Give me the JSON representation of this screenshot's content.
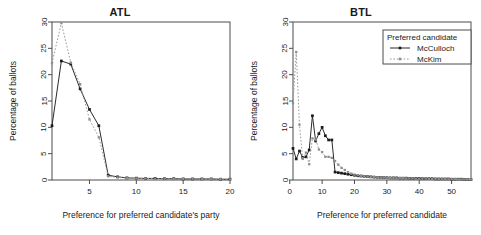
{
  "figure": {
    "width": 481,
    "height": 235,
    "background": "#ffffff"
  },
  "legend": {
    "title": "Preferred candidate",
    "position": "top-right-of-btl-panel",
    "entries": [
      {
        "label": "McCulloch",
        "style": "solid",
        "color": "#2b2b2b",
        "marker": "square"
      },
      {
        "label": "McKim",
        "style": "dotted",
        "color": "#9a9a9a",
        "marker": "square"
      }
    ]
  },
  "chart_data": [
    {
      "type": "line",
      "title": "ATL",
      "xlabel": "Preference for preferred candidate's party",
      "ylabel": "Percentage of ballots",
      "xlim": [
        1,
        20
      ],
      "ylim": [
        0,
        30
      ],
      "xticks": [
        5,
        10,
        15,
        20
      ],
      "yticks": [
        0,
        5,
        10,
        15,
        20,
        25,
        30
      ],
      "grid": false,
      "x": [
        1,
        2,
        3,
        4,
        5,
        6,
        7,
        8,
        9,
        10,
        11,
        12,
        13,
        14,
        15,
        16,
        17,
        18,
        19,
        20
      ],
      "series": [
        {
          "name": "McCulloch",
          "style": "solid",
          "color": "#2b2b2b",
          "values": [
            10.3,
            22.6,
            22.0,
            17.3,
            13.4,
            10.3,
            0.9,
            0.6,
            0.4,
            0.35,
            0.3,
            0.3,
            0.25,
            0.25,
            0.2,
            0.2,
            0.2,
            0.2,
            0.15,
            0.15
          ]
        },
        {
          "name": "McKim",
          "style": "dotted",
          "color": "#9a9a9a",
          "values": [
            22.2,
            29.8,
            22.3,
            18.2,
            11.5,
            8.1,
            0.7,
            0.5,
            0.35,
            0.3,
            0.3,
            0.25,
            0.25,
            0.2,
            0.2,
            0.2,
            0.15,
            0.15,
            0.15,
            0.1
          ]
        }
      ]
    },
    {
      "type": "line",
      "title": "BTL",
      "xlabel": "Preference for preferred candidate",
      "ylabel": "Percentage of ballots",
      "xlim": [
        1,
        56
      ],
      "ylim": [
        0,
        30
      ],
      "xticks": [
        0,
        10,
        20,
        30,
        40,
        50
      ],
      "yticks": [
        0,
        5,
        10,
        15,
        20,
        25,
        30
      ],
      "grid": false,
      "x": [
        1,
        2,
        3,
        4,
        5,
        6,
        7,
        8,
        9,
        10,
        11,
        12,
        13,
        14,
        15,
        16,
        17,
        18,
        19,
        20,
        21,
        22,
        23,
        24,
        25,
        26,
        27,
        28,
        29,
        30,
        31,
        32,
        33,
        34,
        35,
        36,
        37,
        38,
        39,
        40,
        41,
        42,
        43,
        44,
        45,
        46,
        47,
        48,
        49,
        50,
        51,
        52,
        53,
        54,
        55,
        56
      ],
      "series": [
        {
          "name": "McCulloch",
          "style": "solid",
          "color": "#2b2b2b",
          "values": [
            6.0,
            4.0,
            5.5,
            4.3,
            4.4,
            5.7,
            12.2,
            7.4,
            8.8,
            10.0,
            8.4,
            7.6,
            7.6,
            1.5,
            1.4,
            1.3,
            1.2,
            1.1,
            1.0,
            0.9,
            0.8,
            0.75,
            0.7,
            0.65,
            0.6,
            0.55,
            0.5,
            0.5,
            0.45,
            0.45,
            0.4,
            0.4,
            0.4,
            0.35,
            0.35,
            0.35,
            0.3,
            0.3,
            0.3,
            0.3,
            0.25,
            0.25,
            0.25,
            0.25,
            0.2,
            0.2,
            0.2,
            0.2,
            0.2,
            0.15,
            0.15,
            0.15,
            0.15,
            0.1,
            0.1,
            0.1
          ]
        },
        {
          "name": "McKim",
          "style": "dotted",
          "color": "#9a9a9a",
          "values": [
            14.6,
            24.3,
            10.5,
            4.0,
            5.2,
            3.0,
            7.9,
            7.7,
            5.8,
            5.3,
            4.4,
            4.4,
            4.2,
            3.6,
            2.9,
            2.3,
            1.9,
            1.5,
            1.2,
            1.0,
            0.9,
            0.8,
            0.7,
            0.65,
            0.6,
            0.55,
            0.5,
            0.5,
            0.45,
            0.45,
            0.4,
            0.4,
            0.35,
            0.35,
            0.35,
            0.3,
            0.3,
            0.3,
            0.25,
            0.25,
            0.25,
            0.25,
            0.2,
            0.2,
            0.2,
            0.2,
            0.15,
            0.15,
            0.15,
            0.15,
            0.15,
            0.1,
            0.1,
            0.1,
            0.1,
            0.1
          ]
        }
      ]
    }
  ]
}
